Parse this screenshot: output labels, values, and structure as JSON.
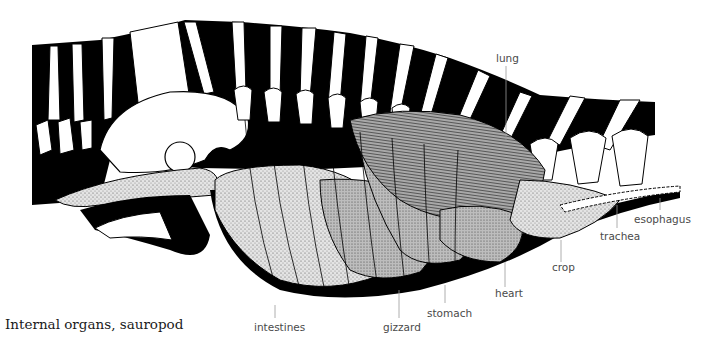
{
  "caption": "Internal organs, sauropod",
  "colors": {
    "background": "#ffffff",
    "ink": "#000000",
    "label_text": "#4a4a4a",
    "leader_line": "#9a9a9a",
    "stipple_light": "#d9d9d9",
    "stipple_mid": "#b5b5b5",
    "stipple_dark": "#8e8e8e"
  },
  "labels": [
    {
      "id": "lung",
      "text": "lung"
    },
    {
      "id": "esophagus",
      "text": "esophagus"
    },
    {
      "id": "trachea",
      "text": "trachea"
    },
    {
      "id": "crop",
      "text": "crop"
    },
    {
      "id": "heart",
      "text": "heart"
    },
    {
      "id": "stomach",
      "text": "stomach"
    },
    {
      "id": "gizzard",
      "text": "gizzard"
    },
    {
      "id": "intestines",
      "text": "intestines"
    }
  ]
}
